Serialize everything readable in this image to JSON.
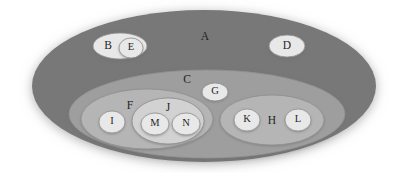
{
  "diagram": {
    "type": "euler-nested-set-diagram",
    "title": "",
    "background_color": "#ffffff",
    "palette": {
      "level_a_fill": "#787878",
      "level_c_fill": "#9e9e9e",
      "level_f_fill": "#b5b5b5",
      "level_h_fill": "#b5b5b5",
      "level_j_fill": "#d2d2d2",
      "leaf_fill": "#e8e8e8",
      "stroke": "#8f8f8f",
      "label_color": "#1f1f1f",
      "shadow_color": "#bdbdbd"
    },
    "sets": [
      {
        "id": "A",
        "label": "A",
        "level": 0,
        "parent": null,
        "fill_key": "level_a_fill",
        "cx": 204,
        "cy": 86,
        "rx": 172,
        "ry": 76,
        "label_x": 205,
        "label_y": 37,
        "label_size": "big"
      },
      {
        "id": "B",
        "label": "B",
        "level": 1,
        "parent": "A",
        "fill_key": "leaf_fill",
        "cx": 120,
        "cy": 46,
        "rx": 27,
        "ry": 13,
        "label_x": 108,
        "label_y": 46,
        "label_size": "big"
      },
      {
        "id": "E",
        "label": "E",
        "level": 2,
        "parent": "B",
        "fill_key": "leaf_fill",
        "cx": 131,
        "cy": 48,
        "rx": 12,
        "ry": 10,
        "label_x": 131,
        "label_y": 48,
        "label_size": "small"
      },
      {
        "id": "D",
        "label": "D",
        "level": 1,
        "parent": "A",
        "fill_key": "leaf_fill",
        "cx": 287,
        "cy": 46,
        "rx": 18,
        "ry": 11,
        "label_x": 287,
        "label_y": 46,
        "label_size": "big"
      },
      {
        "id": "C",
        "label": "C",
        "level": 1,
        "parent": "A",
        "fill_key": "level_c_fill",
        "cx": 207,
        "cy": 114,
        "rx": 138,
        "ry": 44,
        "label_x": 187,
        "label_y": 80,
        "label_size": "big"
      },
      {
        "id": "G",
        "label": "G",
        "level": 2,
        "parent": "C",
        "fill_key": "leaf_fill",
        "cx": 215,
        "cy": 92,
        "rx": 13,
        "ry": 9,
        "label_x": 215,
        "label_y": 92,
        "label_size": "small"
      },
      {
        "id": "F",
        "label": "F",
        "level": 2,
        "parent": "C",
        "fill_key": "level_f_fill",
        "cx": 147,
        "cy": 119,
        "rx": 66,
        "ry": 30,
        "label_x": 130,
        "label_y": 106,
        "label_size": "big"
      },
      {
        "id": "I",
        "label": "I",
        "level": 3,
        "parent": "F",
        "fill_key": "leaf_fill",
        "cx": 112,
        "cy": 122,
        "rx": 13,
        "ry": 11,
        "label_x": 112,
        "label_y": 122,
        "label_size": "small"
      },
      {
        "id": "J",
        "label": "J",
        "level": 3,
        "parent": "F",
        "fill_key": "level_j_fill",
        "cx": 168,
        "cy": 121,
        "rx": 36,
        "ry": 23,
        "label_x": 168,
        "label_y": 108,
        "label_size": "big"
      },
      {
        "id": "M",
        "label": "M",
        "level": 4,
        "parent": "J",
        "fill_key": "leaf_fill",
        "cx": 155,
        "cy": 124,
        "rx": 14,
        "ry": 11,
        "label_x": 155,
        "label_y": 124,
        "label_size": "small"
      },
      {
        "id": "N",
        "label": "N",
        "level": 4,
        "parent": "J",
        "fill_key": "leaf_fill",
        "cx": 186,
        "cy": 124,
        "rx": 14,
        "ry": 11,
        "label_x": 186,
        "label_y": 124,
        "label_size": "small"
      },
      {
        "id": "H",
        "label": "H",
        "level": 2,
        "parent": "C",
        "fill_key": "level_h_fill",
        "cx": 272,
        "cy": 120,
        "rx": 52,
        "ry": 25,
        "label_x": 272,
        "label_y": 121,
        "label_size": "big"
      },
      {
        "id": "K",
        "label": "K",
        "level": 3,
        "parent": "H",
        "fill_key": "leaf_fill",
        "cx": 247,
        "cy": 120,
        "rx": 13,
        "ry": 11,
        "label_x": 247,
        "label_y": 120,
        "label_size": "small"
      },
      {
        "id": "L",
        "label": "L",
        "level": 3,
        "parent": "H",
        "fill_key": "leaf_fill",
        "cx": 298,
        "cy": 120,
        "rx": 13,
        "ry": 11,
        "label_x": 298,
        "label_y": 120,
        "label_size": "small"
      }
    ],
    "labels_order": [
      "A",
      "B",
      "E",
      "D",
      "C",
      "G",
      "F",
      "I",
      "J",
      "M",
      "N",
      "H",
      "K",
      "L"
    ]
  }
}
